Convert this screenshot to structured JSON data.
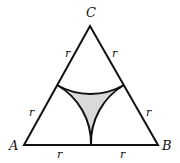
{
  "diagram": {
    "vertices": {
      "A": {
        "label": "A"
      },
      "B": {
        "label": "B"
      },
      "C": {
        "label": "C"
      }
    },
    "side_labels": {
      "ac_upper": "r",
      "ac_lower": "r",
      "bc_upper": "r",
      "bc_lower": "r",
      "ab_left": "r",
      "ab_right": "r"
    },
    "colors": {
      "stroke": "#111111",
      "shaded_fill": "#d9d9d9",
      "background": "#ffffff"
    }
  }
}
